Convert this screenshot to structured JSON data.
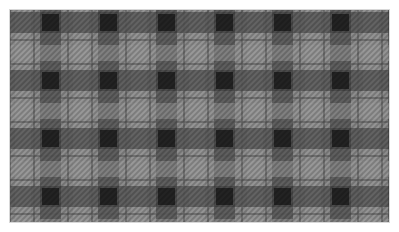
{
  "image": {
    "subject": "grayscale tartan plaid fabric pattern",
    "palette": {
      "background": "#ffffff",
      "border": "#d8d8d8",
      "base": "#8c8c8c",
      "light_band": "#9a9a9a",
      "dark_band": "#3a3a3a",
      "darkest_cross": "#161616",
      "thin_line": "#5a5a5a"
    },
    "repeat": {
      "columns": 6,
      "rows": 4
    }
  }
}
